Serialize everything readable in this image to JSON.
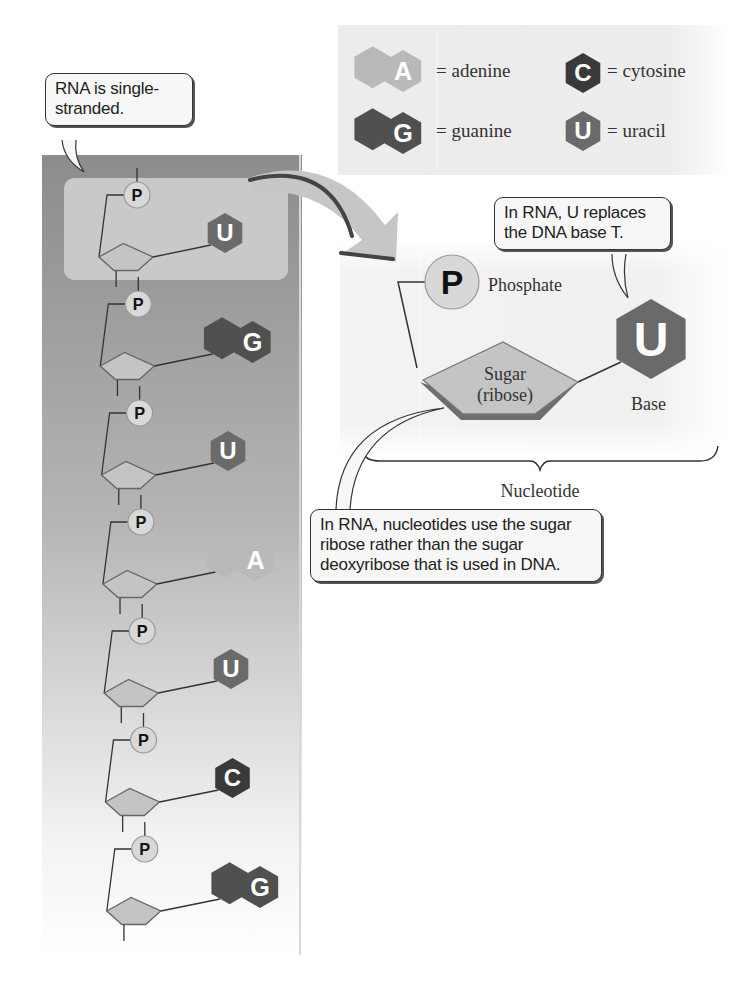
{
  "callouts": {
    "single_stranded": "RNA is single-\nstranded.",
    "u_replaces": "In RNA, U replaces\nthe DNA base T.",
    "ribose": "In RNA, nucleotides use the sugar\nribose rather than the sugar\ndeoxyribose that is used in DNA."
  },
  "legend": {
    "items": [
      {
        "letter": "A",
        "name": "= adenine",
        "shape": "double-hexagon",
        "color": "#b9b9b9"
      },
      {
        "letter": "C",
        "name": "= cytosine",
        "shape": "hexagon",
        "color": "#3a3a3a"
      },
      {
        "letter": "G",
        "name": "= guanine",
        "shape": "double-hexagon",
        "color": "#505050"
      },
      {
        "letter": "U",
        "name": "= uracil",
        "shape": "hexagon",
        "color": "#6a6a6a"
      }
    ]
  },
  "strand": {
    "phosphate_label": "P",
    "nucleotides": [
      {
        "base": "U",
        "shape": "hexagon",
        "color": "#6a6a6a",
        "highlighted": true
      },
      {
        "base": "G",
        "shape": "double-hexagon",
        "color": "#505050"
      },
      {
        "base": "U",
        "shape": "hexagon",
        "color": "#6a6a6a"
      },
      {
        "base": "A",
        "shape": "double-hexagon",
        "color": "#b9b9b9"
      },
      {
        "base": "U",
        "shape": "hexagon",
        "color": "#6a6a6a"
      },
      {
        "base": "C",
        "shape": "hexagon",
        "color": "#3a3a3a"
      },
      {
        "base": "G",
        "shape": "double-hexagon",
        "color": "#505050"
      }
    ]
  },
  "detail": {
    "phosphate_symbol": "P",
    "phosphate_label": "Phosphate",
    "sugar_label_line1": "Sugar",
    "sugar_label_line2": "(ribose)",
    "base_letter": "U",
    "base_label": "Base",
    "brace_label": "Nucleotide"
  },
  "colors": {
    "strand_panel_top": "#8e8e8e",
    "highlight_box": "#c8c8c8",
    "sugar_fill": "#c4c4c4",
    "phosphate_fill": "#d8d8d8",
    "arrow_fill": "#c6c6c6"
  }
}
